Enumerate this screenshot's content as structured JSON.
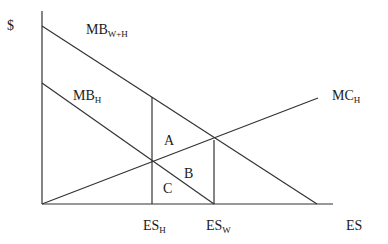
{
  "diagram": {
    "title": "",
    "y_axis_label": "$",
    "x_axis_label": "ES",
    "curves": [
      {
        "id": "mb_wh",
        "label": "MB",
        "subscript": "W+H"
      },
      {
        "id": "mb_h",
        "label": "MB",
        "subscript": "H"
      },
      {
        "id": "mc_h",
        "label": "MC",
        "subscript": "H"
      }
    ],
    "regions": [
      "A",
      "B",
      "C"
    ],
    "x_ticks": [
      {
        "label": "ES",
        "subscript": "H"
      },
      {
        "label": "ES",
        "subscript": "W"
      }
    ]
  }
}
